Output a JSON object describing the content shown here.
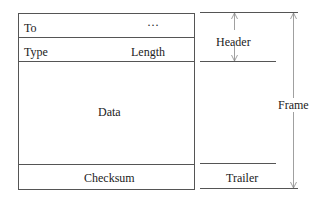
{
  "frame_box": {
    "rows": {
      "to": {
        "left": "To",
        "right": "···"
      },
      "type": {
        "left": "Type",
        "right": "Length"
      },
      "data": "Data",
      "checksum": "Checksum"
    }
  },
  "brackets": {
    "header": "Header",
    "trailer": "Trailer",
    "frame": "Frame"
  },
  "colors": {
    "line": "#555555",
    "arrow": "#888888",
    "text": "#222222"
  }
}
